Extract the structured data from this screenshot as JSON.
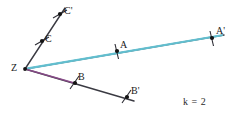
{
  "figure": {
    "scale_factor_text": "k = 2",
    "background_color": "#ffffff",
    "colors": {
      "ray_dark": "#3a3a42",
      "image_ray_highlight": "#63c5d6",
      "preimage_ray_highlight": "#8c4a8c",
      "point_fill": "#141414",
      "tick_mark": "#2b2b33",
      "label_text": "#1a1a1a"
    },
    "center": {
      "name": "Z",
      "label": "Z",
      "x": 25,
      "y": 69,
      "label_x": 11,
      "label_y": 63
    },
    "points": [
      {
        "name": "A",
        "label": "A",
        "x": 117,
        "y": 51,
        "label_x": 120,
        "label_y": 40,
        "tick_angle": 80,
        "role": "preimage"
      },
      {
        "name": "A-prime",
        "label": "A'",
        "x": 212,
        "y": 38,
        "label_x": 216,
        "label_y": 26,
        "tick_angle": 80,
        "role": "image"
      },
      {
        "name": "B",
        "label": "B",
        "x": 75,
        "y": 83,
        "label_x": 78,
        "label_y": 72,
        "tick_angle": 55,
        "role": "preimage"
      },
      {
        "name": "B-prime",
        "label": "B'",
        "x": 127,
        "y": 97,
        "label_x": 131,
        "label_y": 86,
        "tick_angle": 55,
        "role": "image"
      },
      {
        "name": "C",
        "label": "C",
        "x": 42,
        "y": 41,
        "label_x": 45,
        "label_y": 34,
        "tick_angle": 120,
        "role": "preimage"
      },
      {
        "name": "C-prime",
        "label": "C'",
        "x": 60,
        "y": 14,
        "label_x": 64,
        "label_y": 6,
        "tick_angle": 120,
        "role": "image"
      }
    ],
    "rays": [
      {
        "name": "ray-Z-to-A-prime",
        "from_x": 25,
        "from_y": 69,
        "to_x": 224,
        "to_y": 35,
        "stroke": "#3a3a42",
        "width": 1.4,
        "highlight": "#63c5d6",
        "highlight_width": 2.2,
        "highlight_from_x": 28,
        "highlight_from_y": 68,
        "highlight_to_x": 222,
        "highlight_to_y": 35
      },
      {
        "name": "ray-Z-to-B-prime",
        "from_x": 25,
        "from_y": 69,
        "to_x": 134,
        "to_y": 101,
        "stroke": "#3a3a42",
        "width": 1.4,
        "highlight": "#8c4a8c",
        "highlight_width": 1.6,
        "highlight_from_x": 27,
        "highlight_from_y": 69,
        "highlight_to_x": 76,
        "highlight_to_y": 83
      },
      {
        "name": "ray-Z-to-C-prime",
        "from_x": 25,
        "from_y": 69,
        "to_x": 65,
        "to_y": 8,
        "stroke": "#3a3a42",
        "width": 1.4,
        "highlight": "",
        "highlight_width": 0,
        "highlight_from_x": 0,
        "highlight_from_y": 0,
        "highlight_to_x": 0,
        "highlight_to_y": 0
      }
    ],
    "scale_note": {
      "text": "k = 2",
      "x": 183,
      "y": 97
    }
  }
}
